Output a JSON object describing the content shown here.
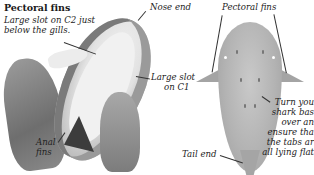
{
  "left_panel": {
    "heading": "Pectoral fins",
    "labels": {
      "slot_c2_line1": "Large slot on C2 just",
      "slot_c2_line2": "below the gills.",
      "nose_end": "Nose end",
      "slot_c1_line1": "Large slot",
      "slot_c1_line2": "on C1",
      "anal_fins_line1": "Anal",
      "anal_fins_line2": "fins"
    }
  },
  "right_panel": {
    "labels": {
      "pectoral_fins": "Pectoral fins",
      "tail_end": "Tail end",
      "instruction_lines": [
        "Turn you",
        "shark bas",
        "over an",
        "ensure tha",
        "the tabs ar",
        "all lying flat"
      ]
    }
  },
  "colors": {
    "background": "#ffffff",
    "text": "#1a1a1a",
    "shark_gray": "#b3b3b3"
  }
}
